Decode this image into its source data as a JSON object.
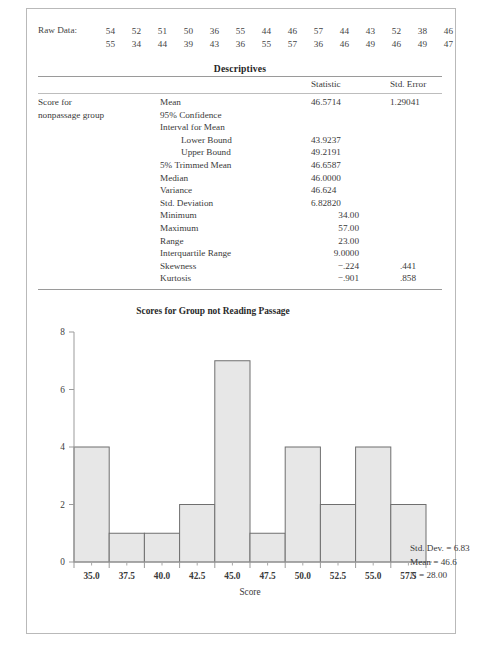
{
  "raw_data": {
    "label": "Raw Data:",
    "rows": [
      [
        "54",
        "52",
        "51",
        "50",
        "36",
        "55",
        "44",
        "46",
        "57",
        "44",
        "43",
        "52",
        "38",
        "46"
      ],
      [
        "55",
        "34",
        "44",
        "39",
        "43",
        "36",
        "55",
        "57",
        "36",
        "46",
        "49",
        "46",
        "49",
        "47"
      ]
    ]
  },
  "descriptives": {
    "title": "Descriptives",
    "columns": [
      "",
      "",
      "Statistic",
      "Std. Error"
    ],
    "group_label_line1": "Score for",
    "group_label_line2": "nonpassage group",
    "rows": [
      {
        "label": "Mean",
        "indent": false,
        "statistic": "46.5714",
        "std_error": "1.29041"
      },
      {
        "label": "95% Confidence",
        "indent": false,
        "statistic": "",
        "std_error": ""
      },
      {
        "label": "Interval for Mean",
        "indent": false,
        "statistic": "",
        "std_error": ""
      },
      {
        "label": "Lower Bound",
        "indent": true,
        "statistic": "43.9237",
        "std_error": ""
      },
      {
        "label": "Upper Bound",
        "indent": true,
        "statistic": "49.2191",
        "std_error": ""
      },
      {
        "label": "5% Trimmed Mean",
        "indent": false,
        "statistic": "46.6587",
        "std_error": ""
      },
      {
        "label": "Median",
        "indent": false,
        "statistic": "46.0000",
        "std_error": ""
      },
      {
        "label": "Variance",
        "indent": false,
        "statistic": "46.624",
        "std_error": ""
      },
      {
        "label": "Std. Deviation",
        "indent": false,
        "statistic": "6.82820",
        "std_error": ""
      },
      {
        "label": "Minimum",
        "indent": false,
        "statistic": "34.00",
        "std_error": ""
      },
      {
        "label": "Maximum",
        "indent": false,
        "statistic": "57.00",
        "std_error": ""
      },
      {
        "label": "Range",
        "indent": false,
        "statistic": "23.00",
        "std_error": ""
      },
      {
        "label": "Interquartile Range",
        "indent": false,
        "statistic": "9.0000",
        "std_error": ""
      },
      {
        "label": "Skewness",
        "indent": false,
        "statistic": "−.224",
        "std_error": ".441"
      },
      {
        "label": "Kurtosis",
        "indent": false,
        "statistic": "−.901",
        "std_error": ".858"
      }
    ]
  },
  "chart_data": {
    "type": "bar",
    "title": "Scores for Group not Reading Passage",
    "xlabel": "Score",
    "ylabel": "",
    "categories": [
      "35.0",
      "37.5",
      "40.0",
      "42.5",
      "45.0",
      "47.5",
      "50.0",
      "52.5",
      "55.0",
      "57.5"
    ],
    "values": [
      4,
      1,
      1,
      2,
      7,
      1,
      4,
      2,
      4,
      2
    ],
    "bin_width": 2.5,
    "bin_centers": [
      35.0,
      37.5,
      40.0,
      42.5,
      45.0,
      47.5,
      50.0,
      52.5,
      55.0,
      57.5
    ],
    "xlim": [
      33.75,
      58.75
    ],
    "ylim": [
      0,
      8
    ],
    "ytick_labels": [
      "0",
      "2",
      "4",
      "6",
      "8"
    ],
    "ytick_values": [
      0,
      2,
      4,
      6,
      8
    ],
    "xtick_labels": [
      "35.0",
      "37.5",
      "40.0",
      "42.5",
      "45.0",
      "47.5",
      "50.0",
      "52.5",
      "55.0",
      "57.5"
    ],
    "grid": false,
    "legend_position": "right",
    "bar_fill": "#e7e7e7",
    "bar_stroke": "#6f6f6f",
    "annotations": {
      "std_dev": "Std. Dev. = 6.83",
      "mean": "Mean = 46.6",
      "n": "N = 28.00"
    }
  }
}
